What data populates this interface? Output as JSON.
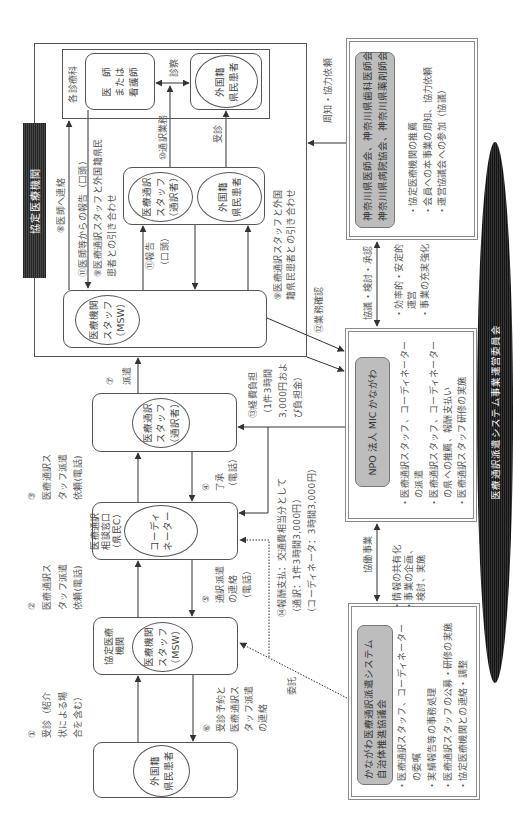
{
  "diagram": {
    "committee": "医療通訳派遣システム事業運営委員会",
    "hospital": {
      "label": "協定医療機関",
      "department": {
        "label": "各診療科",
        "doctor": [
          "医　師",
          "または",
          "看護師"
        ],
        "patient": [
          "外国籍",
          "県民患者"
        ]
      },
      "pair": {
        "interpreter": [
          "医療通訳",
          "スタッフ",
          "（通訳者）"
        ],
        "patient": [
          "外国籍",
          "県民患者"
        ]
      },
      "msw": [
        "医療機関",
        "スタッフ",
        "（MSW）"
      ]
    },
    "flow": {
      "interpreter": [
        "医療通訳",
        "スタッフ",
        "（通訳者）"
      ],
      "consult_desk": [
        "医療通訳",
        "相談窓口",
        "（県民C）"
      ],
      "coordinator": [
        "コーディ",
        "ネーター"
      ],
      "partner_hospital": {
        "label": [
          "協定医療",
          "機関"
        ],
        "msw": [
          "医療機関",
          "スタッフ",
          "（MSW）"
        ]
      },
      "patient": [
        "外国籍",
        "県民患者"
      ]
    },
    "labels": {
      "exam": "診察",
      "consultation": "受診",
      "entrust": "委託",
      "notify": "周知・協力依頼"
    },
    "steps": {
      "s1": [
        "①",
        "受診（紹介",
        "状による場",
        "合を含む）"
      ],
      "s2": [
        "②",
        "医療通訳ス",
        "タッフ派遣",
        "依頼(電話)"
      ],
      "s3": [
        "③",
        "医療通訳ス",
        "タッフ派遣",
        "依頼(電話)"
      ],
      "s4": [
        "④",
        "了承",
        "（電話）"
      ],
      "s5": [
        "⑤",
        "通訳派遣",
        "の連絡",
        "（電話）"
      ],
      "s6": [
        "⑥",
        "受診予約と",
        "医療通訳ス",
        "タッフ派遣",
        "の連絡"
      ],
      "s7": [
        "⑦",
        "派遣"
      ],
      "s8": "⑧医師へ連絡",
      "s9a": [
        "⑨医療通訳スタッフと外国籍県民",
        "患者との引き合わせ"
      ],
      "s9b": [
        "⑨医療通訳スタッフと外国",
        "籍県民患者との引き合わせ"
      ],
      "s10": "⑩通訳業務",
      "s11a": "⑪医師等からの報告（口頭）",
      "s11b": [
        "⑪報告",
        "（口頭）"
      ],
      "s12": "⑫業務確認",
      "s13": [
        "⑬経費負担",
        "（1件3時間",
        "3,000円およ",
        "び負担金）"
      ],
      "s14": [
        "⑭報酬支払：交通費相当分として",
        "（通訳：1件3時間3,000円）",
        "（コーディネータ：3時間3,000円）"
      ]
    },
    "links": {
      "council": {
        "label": "協議・検討・承認",
        "bullets": [
          "・効率的・安定的",
          "運営",
          "・事業の充実強化"
        ]
      },
      "collaboration": {
        "label": "協働事業",
        "bullets": [
          "・情報の共有化",
          "・事業の企画、",
          "検討、実施"
        ]
      }
    },
    "organizations": {
      "medical_associations": {
        "names": [
          "神奈川県医師会、神奈川県歯科医師会",
          "神奈川県病院協会、神奈川県薬剤師会"
        ],
        "lines": [
          "・協定医療機関の推薦",
          "・会員への本事業の周知、協力依頼",
          "・運営協議会への参加（協議）"
        ]
      },
      "npo": {
        "name": "NPO 法人 MIC かながわ",
        "lines": [
          "・医療通訳スタッフ、コーディネーター",
          "の派遣",
          "・医療通訳スタッフ、コーディネーター",
          "の県への推薦、報酬支払い",
          "・医療通訳スタッフ研修の実施"
        ]
      },
      "council_promotion": {
        "names": [
          "かながわ医療通訳派遣システム",
          "自治体推進協議会"
        ],
        "lines": [
          "・医療通訳スタッフ、コーディネーター",
          "の委嘱",
          "・実績報告等の事務処理",
          "・医療通訳スタッフの公募・研修の実施",
          "・協定医療機関との連絡・調整"
        ]
      }
    }
  }
}
